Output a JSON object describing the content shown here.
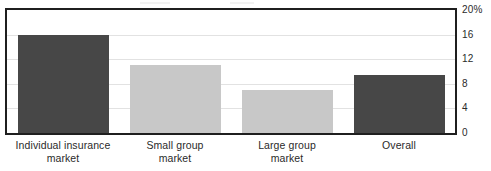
{
  "chart_data": {
    "type": "bar",
    "title": "",
    "xlabel": "",
    "ylabel": "",
    "categories": [
      "Individual insurance market",
      "Small group market",
      "Large group market",
      "Overall"
    ],
    "category_lines": [
      [
        "Individual insurance",
        "market"
      ],
      [
        "Small group",
        "market"
      ],
      [
        "Large group",
        "market"
      ],
      [
        "Overall",
        ""
      ]
    ],
    "values": [
      16,
      11,
      7,
      9.4
    ],
    "ylim": [
      0,
      20
    ],
    "yticks": [
      0,
      4,
      8,
      12,
      16,
      20
    ],
    "ytick_labels": [
      "0",
      "4",
      "8",
      "12",
      "16",
      "20%"
    ],
    "y_axis_position": "right",
    "grid": true,
    "legend": "none",
    "bar_colors": [
      "#474747",
      "#c8c8c8",
      "#c8c8c8",
      "#474747"
    ]
  },
  "style": {
    "dark_bar_color": "#474747",
    "light_bar_color": "#c8c8c8",
    "grid_color": "#e2e2e2",
    "frame_color": "#1f1f1f",
    "text_color": "#2a2a2a",
    "background": "#ffffff"
  }
}
